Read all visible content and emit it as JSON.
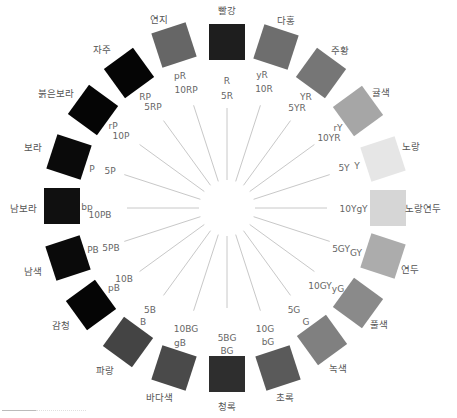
{
  "center": {
    "x": 227,
    "y": 208
  },
  "hues": [
    {
      "name": "빨강",
      "code": "R",
      "tick": "5R",
      "angle": 0,
      "color": "#1e1e1e",
      "name_xy": [
        227,
        11
      ],
      "sq_xy": [
        227,
        42
      ],
      "code_xy": [
        227,
        81
      ],
      "tick_xy": [
        227,
        96
      ]
    },
    {
      "name": "다홍",
      "code": "yR",
      "tick": "10R",
      "angle": 18,
      "color": "#6e6e6e",
      "name_xy": [
        286,
        21
      ],
      "sq_xy": [
        276,
        47
      ],
      "code_xy": [
        262,
        75
      ],
      "tick_xy": [
        264,
        89
      ]
    },
    {
      "name": "주황",
      "code": "YR",
      "tick": "5YR",
      "angle": 36,
      "color": "#767676",
      "name_xy": [
        340,
        51
      ],
      "sq_xy": [
        321,
        73
      ],
      "code_xy": [
        306,
        97
      ],
      "tick_xy": [
        297,
        108
      ]
    },
    {
      "name": "귤색",
      "code": "rY",
      "tick": "10YR",
      "angle": 54,
      "color": "#a6a6a6",
      "name_xy": [
        381,
        93
      ],
      "sq_xy": [
        358,
        111
      ],
      "code_xy": [
        338,
        128
      ],
      "tick_xy": [
        329,
        138
      ]
    },
    {
      "name": "노랑",
      "code": "Y",
      "tick": "5Y",
      "angle": 72,
      "color": "#e6e6e6",
      "name_xy": [
        411,
        147
      ],
      "sq_xy": [
        383,
        159
      ],
      "code_xy": [
        357,
        166
      ],
      "tick_xy": [
        344,
        168
      ]
    },
    {
      "name": "노랑연두",
      "code": "gY",
      "tick": "10Y",
      "angle": 90,
      "color": "#d6d6d6",
      "name_xy": [
        423,
        209
      ],
      "sq_xy": [
        388,
        208
      ],
      "code_xy": [
        362,
        209
      ],
      "tick_xy": [
        348,
        209
      ]
    },
    {
      "name": "연두",
      "code": "GY",
      "tick": "5GY",
      "angle": 108,
      "color": "#acacac",
      "name_xy": [
        410,
        270
      ],
      "sq_xy": [
        383,
        256
      ],
      "code_xy": [
        356,
        253
      ],
      "tick_xy": [
        341,
        249
      ]
    },
    {
      "name": "풀색",
      "code": "yG",
      "tick": "10GY",
      "angle": 126,
      "color": "#8a8a8a",
      "name_xy": [
        379,
        325
      ],
      "sq_xy": [
        358,
        303
      ],
      "code_xy": [
        338,
        289
      ],
      "tick_xy": [
        320,
        286
      ]
    },
    {
      "name": "녹색",
      "code": "G",
      "tick": "5G",
      "angle": 144,
      "color": "#808080",
      "name_xy": [
        338,
        369
      ],
      "sq_xy": [
        322,
        340
      ],
      "code_xy": [
        306,
        322
      ],
      "tick_xy": [
        294,
        310
      ]
    },
    {
      "name": "초록",
      "code": "bG",
      "tick": "10G",
      "angle": 162,
      "color": "#5a5a5a",
      "name_xy": [
        285,
        398
      ],
      "sq_xy": [
        278,
        368
      ],
      "code_xy": [
        268,
        342
      ],
      "tick_xy": [
        265,
        329
      ]
    },
    {
      "name": "청록",
      "code": "BG",
      "tick": "5BG",
      "angle": 180,
      "color": "#2e2e2e",
      "name_xy": [
        227,
        407
      ],
      "sq_xy": [
        227,
        374
      ],
      "code_xy": [
        227,
        351
      ],
      "tick_xy": [
        227,
        338
      ]
    },
    {
      "name": "바다색",
      "code": "gB",
      "tick": "10BG",
      "angle": 198,
      "color": "#4a4a4a",
      "name_xy": [
        159,
        398
      ],
      "sq_xy": [
        174,
        368
      ],
      "code_xy": [
        180,
        343
      ],
      "tick_xy": [
        186,
        329
      ]
    },
    {
      "name": "파랑",
      "code": "B",
      "tick": "5B",
      "angle": 216,
      "color": "#444444",
      "name_xy": [
        105,
        371
      ],
      "sq_xy": [
        128,
        342
      ],
      "code_xy": [
        143,
        322
      ],
      "tick_xy": [
        150,
        310
      ]
    },
    {
      "name": "감청",
      "code": "pB",
      "tick": "10B",
      "angle": 234,
      "color": "#050505",
      "name_xy": [
        61,
        326
      ],
      "sq_xy": [
        91,
        305
      ],
      "code_xy": [
        114,
        288
      ],
      "tick_xy": [
        124,
        279
      ]
    },
    {
      "name": "남색",
      "code": "PB",
      "tick": "5PB",
      "angle": 252,
      "color": "#0a0a0a",
      "name_xy": [
        33,
        272
      ],
      "sq_xy": [
        68,
        258
      ],
      "code_xy": [
        93,
        250
      ],
      "tick_xy": [
        111,
        248
      ]
    },
    {
      "name": "남보라",
      "code": "bp",
      "tick": "10PB",
      "angle": 270,
      "color": "#101010",
      "name_xy": [
        23,
        209
      ],
      "sq_xy": [
        62,
        206
      ],
      "code_xy": [
        87,
        207
      ],
      "tick_xy": [
        100,
        215
      ]
    },
    {
      "name": "보라",
      "code": "P",
      "tick": "5P",
      "angle": 288,
      "color": "#0a0a0a",
      "name_xy": [
        33,
        148
      ],
      "sq_xy": [
        69,
        157
      ],
      "code_xy": [
        92,
        169
      ],
      "tick_xy": [
        110,
        171
      ]
    },
    {
      "name": "붉은보라",
      "code": "rP",
      "tick": "10P",
      "angle": 306,
      "color": "#050505",
      "name_xy": [
        56,
        94
      ],
      "sq_xy": [
        93,
        110
      ],
      "code_xy": [
        113,
        126
      ],
      "tick_xy": [
        121,
        136
      ]
    },
    {
      "name": "자주",
      "code": "RP",
      "tick": "5RP",
      "angle": 324,
      "color": "#050505",
      "name_xy": [
        102,
        50
      ],
      "sq_xy": [
        129,
        73
      ],
      "code_xy": [
        145,
        97
      ],
      "tick_xy": [
        153,
        107
      ]
    },
    {
      "name": "연지",
      "code": "pR",
      "tick": "10RP",
      "angle": 342,
      "color": "#666666",
      "name_xy": [
        159,
        20
      ],
      "sq_xy": [
        174,
        45
      ],
      "code_xy": [
        180,
        76
      ],
      "tick_xy": [
        186,
        90
      ]
    }
  ]
}
